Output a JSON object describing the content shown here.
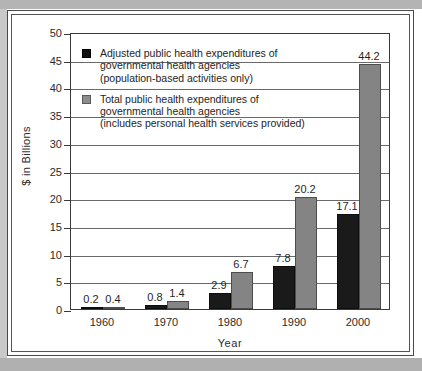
{
  "chart_data": {
    "type": "bar",
    "title": "",
    "subtitle": "",
    "xlabel": "Year",
    "ylabel": "$ in Billions",
    "categories": [
      "1960",
      "1970",
      "1980",
      "1990",
      "2000"
    ],
    "ylim": [
      0,
      50
    ],
    "yticks": [
      0,
      5,
      10,
      15,
      20,
      25,
      30,
      35,
      40,
      45,
      50
    ],
    "ytick_labels": [
      "0",
      "5",
      "10",
      "15",
      "20",
      "25",
      "30",
      "35",
      "40",
      "45",
      "50"
    ],
    "grid": "horizontal",
    "legend_position": "inside-top-left",
    "series": [
      {
        "name": "Adjusted public health expenditures of governmental health agencies (population-based activities only)",
        "color": "#1a1a1a",
        "values": [
          0.2,
          0.8,
          2.9,
          7.8,
          17.1
        ],
        "value_labels": [
          "0.2",
          "0.8",
          "2.9",
          "7.8",
          "17.1"
        ]
      },
      {
        "name": "Total public health expenditures of governmental health agencies (includes personal health services provided)",
        "color": "#848484",
        "values": [
          0.4,
          1.4,
          6.7,
          20.2,
          44.2
        ],
        "value_labels": [
          "0.4",
          "1.4",
          "6.7",
          "20.2",
          "44.2"
        ]
      }
    ]
  },
  "legend": {
    "items": [
      {
        "swatch": "dark",
        "lines": [
          "Adjusted public health expenditures of",
          "governmental health agencies",
          "(population-based activities only)"
        ]
      },
      {
        "swatch": "gray",
        "lines": [
          "Total public health expenditures of",
          "governmental health agencies",
          "(includes personal health services provided)"
        ]
      }
    ]
  },
  "axes": {
    "y_title": "$ in Billions",
    "x_title": "Year"
  },
  "colors": {
    "series_dark": "#1a1a1a",
    "series_gray": "#848484",
    "axis": "#3a3a3a",
    "grid": "#6a6a6a",
    "page_band": "#b4b4b4",
    "text": "#2b2b2b"
  }
}
